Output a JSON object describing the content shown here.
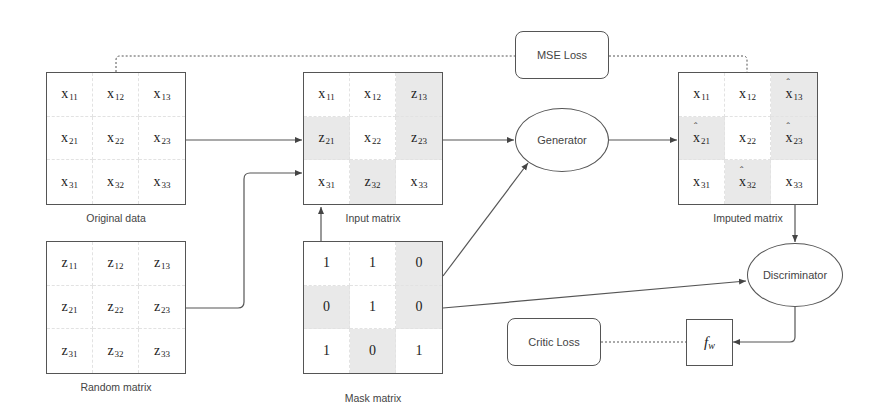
{
  "matrices": {
    "original": {
      "label": "Original data",
      "cells": [
        {
          "v": "x",
          "s": "11",
          "hat": false,
          "shaded": false
        },
        {
          "v": "x",
          "s": "12",
          "hat": false,
          "shaded": false
        },
        {
          "v": "x",
          "s": "13",
          "hat": false,
          "shaded": false
        },
        {
          "v": "x",
          "s": "21",
          "hat": false,
          "shaded": false
        },
        {
          "v": "x",
          "s": "22",
          "hat": false,
          "shaded": false
        },
        {
          "v": "x",
          "s": "23",
          "hat": false,
          "shaded": false
        },
        {
          "v": "x",
          "s": "31",
          "hat": false,
          "shaded": false
        },
        {
          "v": "x",
          "s": "32",
          "hat": false,
          "shaded": false
        },
        {
          "v": "x",
          "s": "33",
          "hat": false,
          "shaded": false
        }
      ]
    },
    "random": {
      "label": "Random matrix",
      "cells": [
        {
          "v": "z",
          "s": "11",
          "hat": false,
          "shaded": false
        },
        {
          "v": "z",
          "s": "12",
          "hat": false,
          "shaded": false
        },
        {
          "v": "z",
          "s": "13",
          "hat": false,
          "shaded": false
        },
        {
          "v": "z",
          "s": "21",
          "hat": false,
          "shaded": false
        },
        {
          "v": "z",
          "s": "22",
          "hat": false,
          "shaded": false
        },
        {
          "v": "z",
          "s": "23",
          "hat": false,
          "shaded": false
        },
        {
          "v": "z",
          "s": "31",
          "hat": false,
          "shaded": false
        },
        {
          "v": "z",
          "s": "32",
          "hat": false,
          "shaded": false
        },
        {
          "v": "z",
          "s": "33",
          "hat": false,
          "shaded": false
        }
      ]
    },
    "input": {
      "label": "Input matrix",
      "cells": [
        {
          "v": "x",
          "s": "11",
          "hat": false,
          "shaded": false
        },
        {
          "v": "x",
          "s": "12",
          "hat": false,
          "shaded": false
        },
        {
          "v": "z",
          "s": "13",
          "hat": false,
          "shaded": true
        },
        {
          "v": "z",
          "s": "21",
          "hat": false,
          "shaded": true
        },
        {
          "v": "x",
          "s": "22",
          "hat": false,
          "shaded": false
        },
        {
          "v": "z",
          "s": "23",
          "hat": false,
          "shaded": true
        },
        {
          "v": "x",
          "s": "31",
          "hat": false,
          "shaded": false
        },
        {
          "v": "z",
          "s": "32",
          "hat": false,
          "shaded": true
        },
        {
          "v": "x",
          "s": "33",
          "hat": false,
          "shaded": false
        }
      ]
    },
    "mask": {
      "label": "Mask matrix",
      "cells": [
        {
          "v": "1",
          "s": "",
          "hat": false,
          "shaded": false
        },
        {
          "v": "1",
          "s": "",
          "hat": false,
          "shaded": false
        },
        {
          "v": "0",
          "s": "",
          "hat": false,
          "shaded": true
        },
        {
          "v": "0",
          "s": "",
          "hat": false,
          "shaded": true
        },
        {
          "v": "1",
          "s": "",
          "hat": false,
          "shaded": false
        },
        {
          "v": "0",
          "s": "",
          "hat": false,
          "shaded": true
        },
        {
          "v": "1",
          "s": "",
          "hat": false,
          "shaded": false
        },
        {
          "v": "0",
          "s": "",
          "hat": false,
          "shaded": true
        },
        {
          "v": "1",
          "s": "",
          "hat": false,
          "shaded": false
        }
      ]
    },
    "imputed": {
      "label": "Imputed matrix",
      "cells": [
        {
          "v": "x",
          "s": "11",
          "hat": false,
          "shaded": false
        },
        {
          "v": "x",
          "s": "12",
          "hat": false,
          "shaded": false
        },
        {
          "v": "x",
          "s": "13",
          "hat": true,
          "shaded": true
        },
        {
          "v": "x",
          "s": "21",
          "hat": true,
          "shaded": true
        },
        {
          "v": "x",
          "s": "22",
          "hat": false,
          "shaded": false
        },
        {
          "v": "x",
          "s": "23",
          "hat": true,
          "shaded": true
        },
        {
          "v": "x",
          "s": "31",
          "hat": false,
          "shaded": false
        },
        {
          "v": "x",
          "s": "32",
          "hat": true,
          "shaded": true
        },
        {
          "v": "x",
          "s": "33",
          "hat": false,
          "shaded": false
        }
      ]
    }
  },
  "nodes": {
    "mse_loss": "MSE Loss",
    "generator": "Generator",
    "discriminator": "Discriminator",
    "critic_loss": "Critic Loss",
    "fw_base": "f",
    "fw_sub": "w"
  },
  "colors": {
    "stroke": "#555555",
    "shaded_cell": "#e9e9e9",
    "background": "#ffffff"
  }
}
